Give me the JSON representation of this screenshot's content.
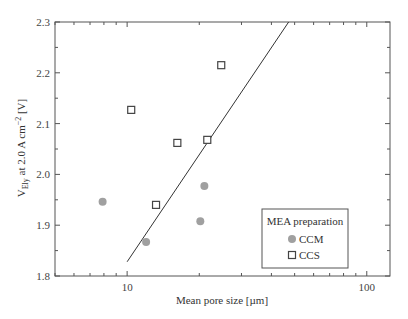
{
  "chart_data": {
    "type": "scatter",
    "title": "",
    "xlabel": "Mean pore size [µm]",
    "ylabel": "V_Ely at 2.0 A cm^-2 [V]",
    "ylabel_parts": {
      "base": "V",
      "sub": "Ely",
      "mid": " at 2.0 A cm",
      "sup": "−2",
      "end": " [V]"
    },
    "xscale": "log",
    "xlim": [
      5,
      125
    ],
    "ylim": [
      1.8,
      2.3
    ],
    "x_ticks": [
      10,
      100
    ],
    "x_tick_labels": [
      "10",
      "100"
    ],
    "y_ticks": [
      1.8,
      1.9,
      2.0,
      2.1,
      2.2,
      2.3
    ],
    "y_tick_labels": [
      "1.8",
      "1.9",
      "2.0",
      "2.1",
      "2.2",
      "2.3"
    ],
    "grid": false,
    "legend": {
      "title": "MEA preparation",
      "position": "lower right",
      "entries": [
        "CCM",
        "CCS"
      ]
    },
    "series": [
      {
        "name": "CCM",
        "marker": "filled-circle",
        "color": "#a0a0a0",
        "x": [
          7.9,
          12.0,
          20.2,
          21.0
        ],
        "y": [
          1.946,
          1.867,
          1.908,
          1.977
        ]
      },
      {
        "name": "CCS",
        "marker": "open-square",
        "color": "#444444",
        "x": [
          10.4,
          13.2,
          16.2,
          21.6,
          24.7
        ],
        "y": [
          2.127,
          1.94,
          2.062,
          2.068,
          2.215
        ]
      }
    ],
    "trend_line": {
      "type": "linear-in-log-x",
      "x": [
        10,
        47.2
      ],
      "y": [
        1.828,
        2.3
      ],
      "color": "#333333"
    }
  }
}
